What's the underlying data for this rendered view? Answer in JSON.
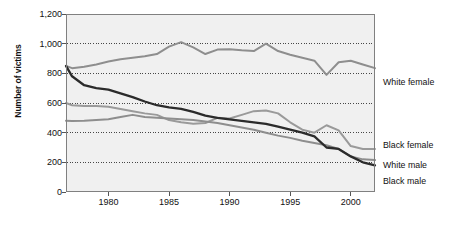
{
  "chart_data": {
    "type": "line",
    "title": "",
    "xlabel": "",
    "ylabel": "Number of victims",
    "xlim": [
      1976.5,
      2002.0
    ],
    "ylim": [
      0,
      1200
    ],
    "grid": "horizontal-dotted",
    "legend_position": "right-inline",
    "yticks": [
      "0",
      "200",
      "400",
      "600",
      "800",
      "1,000",
      "1,200"
    ],
    "ytick_values": [
      0,
      200,
      400,
      600,
      800,
      1000,
      1200
    ],
    "xticks": [
      "1980",
      "1985",
      "1990",
      "1995",
      "2000"
    ],
    "xtick_values": [
      1980,
      1985,
      1990,
      1995,
      2000
    ],
    "x": [
      1976.5,
      1977,
      1978,
      1979,
      1980,
      1981,
      1982,
      1983,
      1984,
      1985,
      1986,
      1987,
      1988,
      1989,
      1990,
      1991,
      1992,
      1993,
      1994,
      1995,
      1996,
      1997,
      1998,
      1999,
      2000,
      2001,
      2002
    ],
    "series": [
      {
        "name": "White female",
        "color": "#8e8e8e",
        "values": [
          850,
          835,
          845,
          860,
          880,
          895,
          905,
          915,
          930,
          980,
          1010,
          975,
          930,
          960,
          962,
          955,
          950,
          1000,
          950,
          925,
          905,
          885,
          790,
          875,
          885,
          860,
          835
        ]
      },
      {
        "name": "Black female",
        "color": "#9a9a9a",
        "values": [
          600,
          585,
          580,
          580,
          575,
          560,
          545,
          530,
          520,
          485,
          470,
          460,
          465,
          500,
          495,
          520,
          545,
          550,
          530,
          470,
          420,
          400,
          450,
          415,
          310,
          290,
          290
        ]
      },
      {
        "name": "White male",
        "color": "#8e8e8e",
        "values": [
          480,
          478,
          480,
          485,
          490,
          505,
          520,
          505,
          500,
          495,
          490,
          485,
          475,
          465,
          450,
          435,
          420,
          400,
          380,
          365,
          345,
          330,
          315,
          290,
          240,
          220,
          215
        ]
      },
      {
        "name": "Black male",
        "color": "#2b2b2b",
        "values": [
          850,
          780,
          720,
          700,
          690,
          665,
          640,
          610,
          585,
          570,
          560,
          540,
          515,
          500,
          490,
          480,
          470,
          460,
          440,
          420,
          400,
          375,
          300,
          290,
          240,
          200,
          180
        ]
      }
    ],
    "legend_entries": [
      {
        "label": "White female",
        "y_px": 82
      },
      {
        "label": "Black female",
        "y_px": 145
      },
      {
        "label": "White male",
        "y_px": 165
      },
      {
        "label": "Black male",
        "y_px": 181
      }
    ]
  },
  "plot": {
    "bg_color": "#f0f0f0",
    "border_color": "#808080",
    "grid_color": "#333333"
  }
}
